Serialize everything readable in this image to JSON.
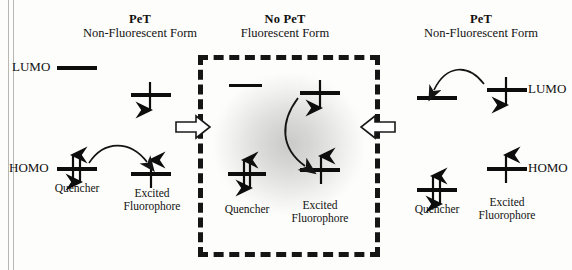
{
  "diagram": {
    "colors": {
      "ink": "#0d0d0d",
      "paper": "#fdfdfb",
      "glow": "#8a8a8a",
      "rule": "#b9b7b2"
    }
  },
  "panels": [
    {
      "id": "left",
      "title": "PeT",
      "subtitle": "Non-Fluorescent Form",
      "boxed": false,
      "orbital_labels": {
        "lumo": "LUMO",
        "homo": "HOMO"
      },
      "species": [
        {
          "name": "quencher",
          "caption": "Quencher",
          "homo_occupancy": "paired",
          "lumo_occupancy": "empty"
        },
        {
          "name": "fluorophore",
          "caption_line1": "Excited",
          "caption_line2": "Fluorophore",
          "homo_occupancy": "single-up",
          "lumo_occupancy": "single-down"
        }
      ],
      "transfer_arrow": "quencher-homo-to-fluorophore-homo"
    },
    {
      "id": "center",
      "title": "No PeT",
      "subtitle": "Fluorescent Form",
      "boxed": true,
      "orbital_labels": {
        "lumo": "",
        "homo": ""
      },
      "species": [
        {
          "name": "quencher",
          "caption": "Quencher",
          "homo_occupancy": "paired",
          "lumo_occupancy": "empty"
        },
        {
          "name": "fluorophore",
          "caption_line1": "Excited",
          "caption_line2": "Fluorophore",
          "homo_occupancy": "single-up",
          "lumo_occupancy": "single-down"
        }
      ],
      "transfer_arrow": "fluorophore-lumo-to-fluorophore-homo"
    },
    {
      "id": "right",
      "title": "PeT",
      "subtitle": "Non-Fluorescent Form",
      "boxed": false,
      "orbital_labels": {
        "lumo": "LUMO",
        "homo": "HOMO"
      },
      "species": [
        {
          "name": "quencher",
          "caption": "Quencher",
          "homo_occupancy": "paired",
          "lumo_occupancy": "empty"
        },
        {
          "name": "fluorophore",
          "caption_line1": "Excited",
          "caption_line2": "Fluorophore",
          "homo_occupancy": "single-up",
          "lumo_occupancy": "single-down"
        }
      ],
      "transfer_arrow": "fluorophore-lumo-to-quencher-lumo"
    }
  ],
  "flow_arrows": [
    {
      "id": "left-to-center",
      "direction": "right",
      "glyph": "⇨"
    },
    {
      "id": "right-to-center",
      "direction": "left",
      "glyph": "⇦"
    }
  ]
}
